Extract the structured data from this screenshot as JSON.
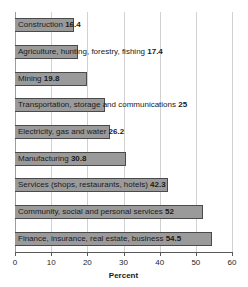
{
  "chart_data": {
    "type": "bar",
    "orientation": "horizontal",
    "title": "",
    "xlabel": "Percent",
    "ylabel": "",
    "xlim": [
      0,
      60
    ],
    "xticks": [
      0,
      10,
      20,
      30,
      40,
      50,
      60
    ],
    "grid": true,
    "legend": null,
    "bar_color": "#9a9a9a",
    "bar_edge_color": "#4a4a4a",
    "categories": [
      "Construction",
      "Agriculture, hunting, forestry, fishing",
      "Mining",
      "Transportation, storage and communications",
      "Electricity, gas and water",
      "Manufacturing",
      "Services (shops, restaurants, hotels)",
      "Community, social and personal services",
      "Finance, insurance, real estate, business"
    ],
    "values": [
      16.4,
      17.4,
      19.8,
      25,
      26.2,
      30.8,
      42.3,
      52,
      54.5
    ],
    "value_labels": [
      "16.4",
      "17.4",
      "19.8",
      "25",
      "26.2",
      "30.8",
      "42.3",
      "52",
      "54.5"
    ]
  },
  "axis": {
    "title": "Percent",
    "tick_labels": [
      "0",
      "10",
      "20",
      "30",
      "40",
      "50",
      "60"
    ]
  }
}
